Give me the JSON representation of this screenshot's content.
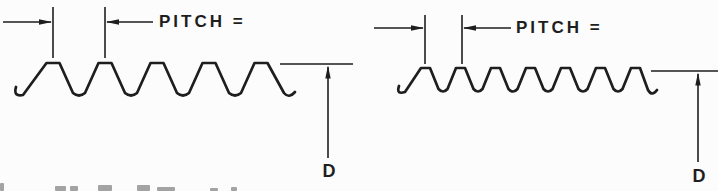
{
  "figure": {
    "background": "#fcfcfc",
    "ink": "#1e1e1e",
    "caption_fragment_color": "#4a4a4a"
  },
  "diagrams": [
    {
      "name": "coarse-thread",
      "pitch_label": "PITCH =",
      "diameter_label": "D",
      "geometry": {
        "peaks": 5,
        "x0": 53,
        "pitch": 52,
        "crest_y": 63,
        "trough_y": 96,
        "flat": 13,
        "trough_r": 6,
        "start_hook": [
          [
            16,
            87
          ],
          [
            13,
            97
          ],
          [
            23,
            95
          ]
        ],
        "end_hook": [
          [
            284,
            93
          ],
          [
            289,
            99
          ],
          [
            295,
            92
          ]
        ],
        "ext_lines": {
          "x1": 53,
          "x2": 105,
          "top": 7,
          "bottom": 58
        },
        "arrow_y": 22,
        "arrow_left_start": 3,
        "arrow_right_end": 153,
        "d_line": {
          "x1": 280,
          "x2": 353,
          "y": 64,
          "arrow_x": 328,
          "arrow_bottom": 158
        }
      }
    },
    {
      "name": "fine-thread",
      "pitch_label": "PITCH =",
      "diameter_label": "D",
      "geometry": {
        "peaks": 7,
        "x0": 425.5,
        "pitch": 35,
        "crest_y": 68,
        "trough_y": 92,
        "flat": 9,
        "trough_r": 4.5,
        "start_hook": [
          [
            399,
            86
          ],
          [
            396,
            95
          ],
          [
            405,
            92
          ]
        ],
        "end_hook": [
          [
            648,
            90
          ],
          [
            652,
            97
          ],
          [
            657,
            90
          ]
        ],
        "ext_lines": {
          "x1": 425,
          "x2": 462,
          "top": 15,
          "bottom": 64
        },
        "arrow_y": 28,
        "arrow_left_start": 374,
        "arrow_right_end": 511,
        "d_line": {
          "x1": 651,
          "x2": 718,
          "y": 71,
          "arrow_x": 698,
          "arrow_bottom": 162
        }
      }
    }
  ],
  "caption_fragments": [
    {
      "x": 0,
      "y": 183,
      "w": 4,
      "h": 8
    },
    {
      "x": 55,
      "y": 186,
      "w": 11,
      "h": 5
    },
    {
      "x": 70,
      "y": 186,
      "w": 8,
      "h": 5
    },
    {
      "x": 98,
      "y": 185,
      "w": 14,
      "h": 6
    },
    {
      "x": 137,
      "y": 185,
      "w": 13,
      "h": 6
    },
    {
      "x": 157,
      "y": 187,
      "w": 18,
      "h": 4
    },
    {
      "x": 210,
      "y": 188,
      "w": 8,
      "h": 3
    },
    {
      "x": 231,
      "y": 187,
      "w": 6,
      "h": 4
    }
  ]
}
